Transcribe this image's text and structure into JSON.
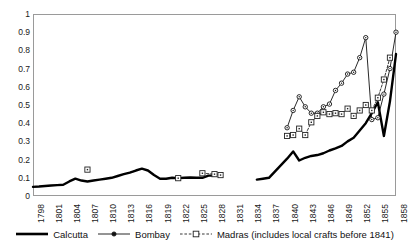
{
  "chart_data": {
    "type": "line",
    "title": "",
    "xlabel": "",
    "ylabel": "",
    "xlim": [
      1798,
      1858
    ],
    "ylim": [
      0,
      1
    ],
    "grid": false,
    "legend_position": "bottom",
    "xticks": [
      "1798",
      "1801",
      "1804",
      "1807",
      "1810",
      "1813",
      "1816",
      "1819",
      "1822",
      "1825",
      "1828",
      "1831",
      "1834",
      "1837",
      "1840",
      "1843",
      "1846",
      "1849",
      "1852",
      "1855",
      "1858"
    ],
    "yticks": [
      "0",
      "0.1",
      "0.2",
      "0.3",
      "0.4",
      "0.5",
      "0.6",
      "0.7",
      "0.8",
      "0.9",
      "1"
    ],
    "series": [
      {
        "name": "Calcutta",
        "style": "solid-thick",
        "color": "#000000",
        "marker": "none",
        "x": [
          1798,
          1799,
          1800,
          1801,
          1802,
          1803,
          1804,
          1805,
          1806,
          1807,
          1808,
          1809,
          1810,
          1811,
          1812,
          1813,
          1814,
          1815,
          1816,
          1817,
          1818,
          1819,
          1820,
          1821,
          1822,
          1823,
          1824,
          1825,
          1826,
          1827,
          1828,
          1835,
          1836,
          1837,
          1840,
          1841,
          1842,
          1843,
          1844,
          1845,
          1846,
          1847,
          1848,
          1849,
          1850,
          1851,
          1852,
          1853,
          1854,
          1855,
          1856,
          1857,
          1858
        ],
        "y": [
          0.05,
          0.052,
          0.055,
          0.058,
          0.06,
          0.062,
          0.08,
          0.095,
          0.085,
          0.08,
          0.085,
          0.09,
          0.095,
          0.1,
          0.11,
          0.12,
          0.128,
          0.14,
          0.15,
          0.14,
          0.115,
          0.095,
          0.095,
          0.1,
          0.098,
          0.1,
          0.102,
          0.1,
          0.1,
          0.112,
          0.112,
          0.09,
          0.095,
          0.1,
          0.205,
          0.245,
          0.195,
          0.21,
          0.22,
          0.225,
          0.235,
          0.25,
          0.262,
          0.275,
          0.3,
          0.32,
          0.36,
          0.4,
          0.455,
          0.515,
          0.33,
          0.52,
          0.78
        ]
      },
      {
        "name": "Bombay",
        "style": "solid-thin",
        "color": "#111111",
        "marker": "circle",
        "x": [
          1840,
          1841,
          1842,
          1843,
          1844,
          1845,
          1846,
          1847,
          1848,
          1849,
          1850,
          1851,
          1852,
          1853,
          1854,
          1855,
          1856,
          1857,
          1858
        ],
        "y": [
          0.375,
          0.47,
          0.545,
          0.49,
          0.455,
          0.455,
          0.49,
          0.505,
          0.58,
          0.62,
          0.67,
          0.68,
          0.76,
          0.87,
          0.42,
          0.43,
          0.56,
          0.7,
          0.9
        ]
      },
      {
        "name": "Madras (includes local crafts before 1841)",
        "style": "dashed",
        "color": "#222222",
        "marker": "square",
        "x": [
          1807,
          1822,
          1826,
          1828,
          1829,
          1840,
          1841,
          1842,
          1843,
          1844,
          1845,
          1846,
          1847,
          1848,
          1849,
          1850,
          1851,
          1852,
          1853,
          1854,
          1855,
          1856,
          1857
        ],
        "y": [
          0.145,
          0.098,
          0.125,
          0.12,
          0.115,
          0.33,
          0.335,
          0.37,
          0.335,
          0.405,
          0.44,
          0.46,
          0.45,
          0.455,
          0.45,
          0.48,
          0.44,
          0.47,
          0.5,
          0.47,
          0.54,
          0.64,
          0.76
        ]
      }
    ]
  },
  "legend": {
    "items": [
      {
        "label": "Calcutta",
        "key": "solid-thick-line-key"
      },
      {
        "label": "Bombay",
        "key": "line-circle-key"
      },
      {
        "label": "Madras (includes local crafts before 1841)",
        "key": "dashed-square-key"
      }
    ]
  }
}
